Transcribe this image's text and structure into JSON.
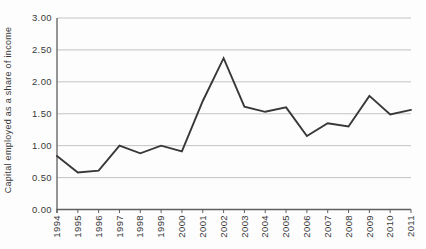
{
  "chart_data": {
    "type": "line",
    "title": "",
    "xlabel": "",
    "ylabel": "Capital employed as a share of income",
    "categories": [
      "1994",
      "1995",
      "1996",
      "1997",
      "1998",
      "1999",
      "2000",
      "2001",
      "2002",
      "2003",
      "2004",
      "2005",
      "2006",
      "2007",
      "2008",
      "2009",
      "2010",
      "2011"
    ],
    "values": [
      0.84,
      0.58,
      0.61,
      1.0,
      0.88,
      1.0,
      0.91,
      1.7,
      2.37,
      1.61,
      1.53,
      1.6,
      1.15,
      1.35,
      1.3,
      1.78,
      1.49,
      1.56
    ],
    "ylim": [
      0,
      3
    ],
    "ytick_step": 0.5,
    "ytick_labels": [
      "0.00",
      "0.50",
      "1.00",
      "1.50",
      "2.00",
      "2.50",
      "3.00"
    ],
    "grid": true,
    "legend_position": "none",
    "x_tick_rotation_degrees": 90
  },
  "colors": {
    "background": "#fdfdfd",
    "line": "#383838",
    "grid": "#c3c3c3",
    "axis": "#5f5f5f",
    "text": "#3a3a3a"
  }
}
